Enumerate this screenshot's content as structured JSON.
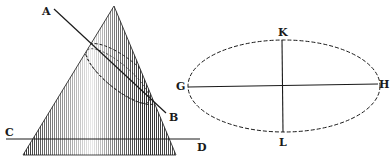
{
  "figure": {
    "colors": {
      "ink": "#1a1a1a",
      "paper": "#ffffff"
    }
  },
  "cone": {
    "labels": {
      "A": "A",
      "B": "B",
      "C": "C",
      "D": "D"
    }
  },
  "ellipse": {
    "labels": {
      "G": "G",
      "H": "H",
      "K": "K",
      "L": "L"
    },
    "major_axis": "GH",
    "minor_axis": "KL"
  }
}
